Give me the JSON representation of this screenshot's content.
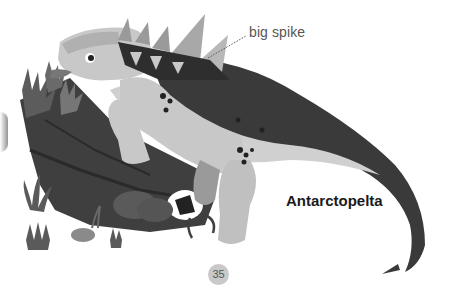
{
  "page": {
    "annotation_label": "big spike",
    "species_name": "Antarctopelta",
    "page_number": "35"
  },
  "illustration": {
    "subject": "armored dinosaur",
    "elements": [
      "dinosaur",
      "fallen-log",
      "ferns",
      "grass-tufts",
      "rocks",
      "roots"
    ]
  },
  "colors": {
    "background": "#ffffff",
    "body_light": "#c8c8c8",
    "body_armor": "#3a3a3a",
    "log": "#4a4a4a",
    "page_badge": "#c9c9c9",
    "label_text": "#555555",
    "name_text": "#1a1a1a"
  }
}
